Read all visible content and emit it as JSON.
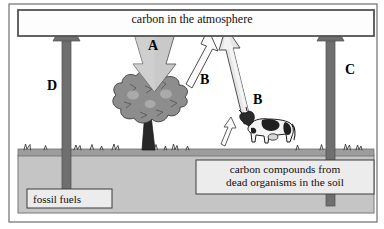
{
  "diagram": {
    "atmosphere": {
      "label": "carbon in the atmosphere"
    },
    "reservoirs": [
      {
        "name": "fossil-fuels",
        "label": "fossil fuels"
      },
      {
        "name": "soil-carbon",
        "label": "carbon compounds from dead organisms in the soil"
      }
    ],
    "soil_label_lines": {
      "line1": "carbon compounds from",
      "line2": "dead organisms in the soil"
    },
    "fluxes": [
      {
        "id": "A",
        "letter": "A",
        "direction": "down",
        "from": "atmosphere",
        "to": "tree",
        "style": "filled-light-gray"
      },
      {
        "id": "B1",
        "letter": "B",
        "direction": "up",
        "from": "tree",
        "to": "atmosphere",
        "style": "outline-white"
      },
      {
        "id": "B2",
        "letter": "B",
        "direction": "up",
        "from": "cow",
        "to": "atmosphere",
        "style": "outline-light"
      },
      {
        "id": "C",
        "letter": "C",
        "direction": "up",
        "from": "soil",
        "to": "atmosphere",
        "style": "filled-dark-gray"
      },
      {
        "id": "D",
        "letter": "D",
        "direction": "up",
        "from": "fossil-fuels",
        "to": "atmosphere",
        "style": "filled-dark-gray"
      }
    ],
    "organisms": [
      {
        "name": "tree",
        "label": "tree"
      },
      {
        "name": "cow",
        "label": "cow"
      }
    ],
    "colors": {
      "frame_stroke": "#555555",
      "atmosphere_fill": "#fdfdfd",
      "soil_fill": "#c4c4c4",
      "ground_fill": "#9a9a9a",
      "arrow_dark": "#6d6d6d",
      "arrow_light": "#cfcfcf",
      "arrow_outline": "#ffffff",
      "tree_canopy": "#8e8e8e",
      "tree_trunk": "#2a2a2a",
      "box_fill": "#ececec",
      "text": "#101010"
    }
  }
}
